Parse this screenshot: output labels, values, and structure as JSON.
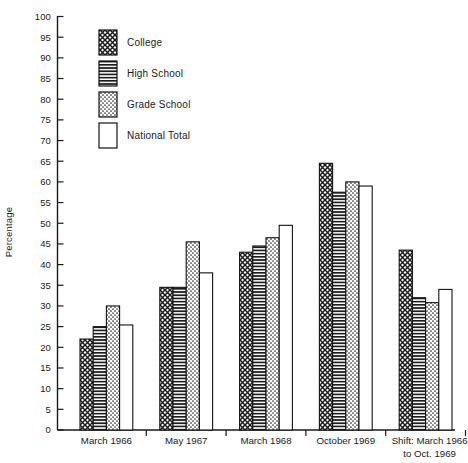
{
  "chart_data": {
    "type": "bar",
    "title": "",
    "xlabel": "",
    "ylabel": "Percentage",
    "ylim": [
      0,
      100
    ],
    "ytick_step": 5,
    "grid": false,
    "legend_position": "upper-left-inside",
    "categories": [
      "March 1966",
      "May 1967",
      "March 1968",
      "October 1969",
      "Shift: March 1966 to Oct. 1969"
    ],
    "category_lines": [
      [
        "March 1966"
      ],
      [
        "May 1967"
      ],
      [
        "March 1968"
      ],
      [
        "October 1969"
      ],
      [
        "Shift: March 1966",
        "to Oct. 1969"
      ]
    ],
    "series": [
      {
        "name": "College",
        "pattern": "crosshatch",
        "values": [
          22,
          34.5,
          43,
          64.5,
          43.5
        ]
      },
      {
        "name": "High School",
        "pattern": "horizontal",
        "values": [
          25,
          34.5,
          44.5,
          57.5,
          32
        ]
      },
      {
        "name": "Grade School",
        "pattern": "stipple",
        "values": [
          30,
          45.5,
          46.5,
          60,
          30.8
        ]
      },
      {
        "name": "National Total",
        "pattern": "blank",
        "values": [
          25.4,
          38,
          49.5,
          59,
          34
        ]
      }
    ],
    "yticks": [
      0,
      5,
      10,
      15,
      20,
      25,
      30,
      35,
      40,
      45,
      50,
      55,
      60,
      65,
      70,
      75,
      80,
      85,
      90,
      95,
      100
    ]
  },
  "legend": {
    "items": [
      {
        "label": "College"
      },
      {
        "label": "High School"
      },
      {
        "label": "Grade School"
      },
      {
        "label": "National Total"
      }
    ]
  },
  "colors": {
    "ink": "#121212",
    "background": "#ffffff"
  }
}
